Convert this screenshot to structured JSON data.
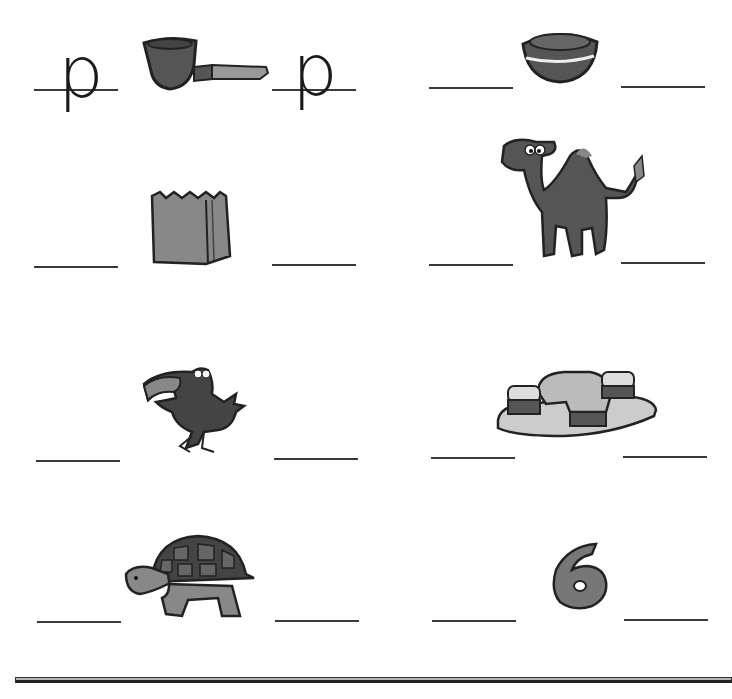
{
  "worksheet": {
    "type": "beginning and ending sound fill-in",
    "rows": [
      {
        "left": {
          "picture": "pipe",
          "start_letter": "p",
          "end_letter": "p"
        },
        "right": {
          "picture": "bowl",
          "start_letter": "",
          "end_letter": ""
        }
      },
      {
        "left": {
          "picture": "paper bag",
          "start_letter": "",
          "end_letter": ""
        },
        "right": {
          "picture": "camel",
          "start_letter": "",
          "end_letter": ""
        }
      },
      {
        "left": {
          "picture": "crow",
          "start_letter": "",
          "end_letter": ""
        },
        "right": {
          "picture": "phone",
          "start_letter": "",
          "end_letter": ""
        }
      },
      {
        "left": {
          "picture": "turtle",
          "start_letter": "",
          "end_letter": ""
        },
        "right": {
          "picture": "six",
          "start_letter": "",
          "end_letter": ""
        }
      }
    ]
  },
  "colors": {
    "ink": "#1a1a1a",
    "dark_fill": "#555555",
    "mid_fill": "#8a8a8a",
    "light_fill": "#c8c8c8"
  }
}
